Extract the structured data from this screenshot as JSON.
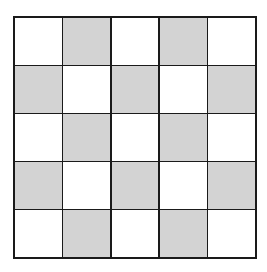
{
  "diagram": {
    "type": "checkerboard-grid",
    "rows": 5,
    "cols": 5,
    "colors": {
      "light": "#ffffff",
      "shaded": "#d3d3d3",
      "line": "#1a1a1a"
    },
    "cells": [
      [
        0,
        1,
        0,
        1,
        0
      ],
      [
        1,
        0,
        1,
        0,
        1
      ],
      [
        0,
        1,
        0,
        1,
        0
      ],
      [
        1,
        0,
        1,
        0,
        1
      ],
      [
        0,
        1,
        0,
        1,
        0
      ]
    ]
  }
}
